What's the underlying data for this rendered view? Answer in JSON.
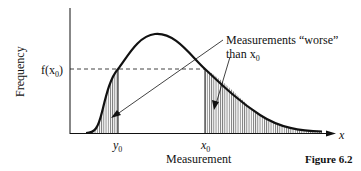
{
  "figure": {
    "caption": "Figure 6.2",
    "y_axis_label": "Frequency",
    "x_axis_label": "Measurement",
    "x_axis_symbol": "x",
    "fx0_label": "f(x",
    "fx0_sub": "0",
    "fx0_close": ")",
    "y0_label": "y",
    "y0_sub": "0",
    "x0_label": "x",
    "x0_sub": "0",
    "annotation_line1": "Measurements “worse”",
    "annotation_line2": "than x",
    "annotation_sub": "0"
  },
  "colors": {
    "ink": "#111111",
    "background": "#ffffff"
  }
}
